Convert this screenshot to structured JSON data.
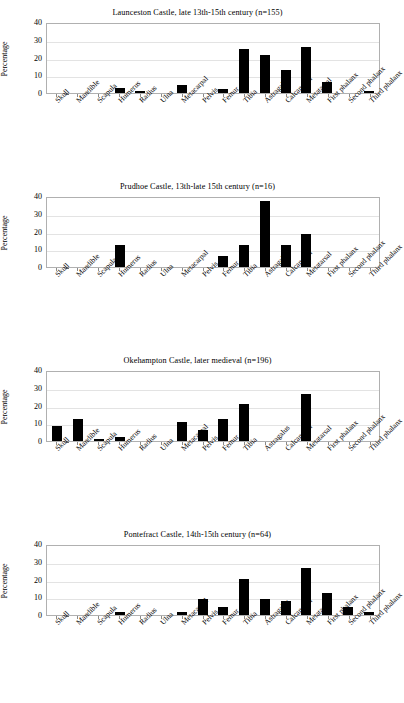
{
  "figure": {
    "categories": [
      "Skull",
      "Mandible",
      "Scapula",
      "Humerus",
      "Radius",
      "Ulna",
      "Metacarpal",
      "Pelvis",
      "Femur",
      "Tibia",
      "Astragalus",
      "Calcaneum",
      "Metatarsal",
      "First phalanx",
      "Second phalanx",
      "Third phalanx"
    ],
    "ylabel": "Percentage",
    "yticks": [
      "0",
      "10",
      "20",
      "30",
      "40"
    ],
    "ylim": [
      0,
      40
    ]
  },
  "chart_data": [
    {
      "type": "bar",
      "title": "Launceston Castle, late 13th-15th century (n=155)",
      "xlabel": "",
      "ylabel": "Percentage",
      "ylim": [
        0,
        40
      ],
      "yticks": [
        0,
        10,
        20,
        30,
        40
      ],
      "grid": true,
      "legend": "none",
      "categories": [
        "Skull",
        "Mandible",
        "Scapula",
        "Humerus",
        "Radius",
        "Ulna",
        "Metacarpal",
        "Pelvis",
        "Femur",
        "Tibia",
        "Astragalus",
        "Calcaneum",
        "Metatarsal",
        "First phalanx",
        "Second phalanx",
        "Third phalanx"
      ],
      "values": [
        0,
        0,
        0,
        2.6,
        1.3,
        0,
        4.5,
        0,
        2.3,
        25.2,
        21.9,
        12.9,
        26.5,
        6.5,
        0,
        1.3
      ]
    },
    {
      "type": "bar",
      "title": "Prudhoe Castle, 13th-late 15th century (n=16)",
      "xlabel": "",
      "ylabel": "Percentage",
      "ylim": [
        0,
        40
      ],
      "yticks": [
        0,
        10,
        20,
        30,
        40
      ],
      "grid": true,
      "legend": "none",
      "categories": [
        "Skull",
        "Mandible",
        "Scapula",
        "Humerus",
        "Radius",
        "Ulna",
        "Metacarpal",
        "Pelvis",
        "Femur",
        "Tibia",
        "Astragalus",
        "Calcaneum",
        "Metatarsal",
        "First phalanx",
        "Second phalanx",
        "Third phalanx"
      ],
      "values": [
        0,
        0,
        0,
        12.5,
        0,
        0,
        0,
        0,
        6.3,
        12.5,
        37.5,
        12.5,
        18.8,
        0,
        0,
        0
      ]
    },
    {
      "type": "bar",
      "title": "Okehampton Castle, later medieval (n=196)",
      "xlabel": "",
      "ylabel": "Percentage",
      "ylim": [
        0,
        40
      ],
      "yticks": [
        0,
        10,
        20,
        30,
        40
      ],
      "grid": true,
      "legend": "none",
      "categories": [
        "Skull",
        "Mandible",
        "Scapula",
        "Humerus",
        "Radius",
        "Ulna",
        "Metacarpal",
        "Pelvis",
        "Femur",
        "Tibia",
        "Astragalus",
        "Calcaneum",
        "Metatarsal",
        "First phalanx",
        "Second phalanx",
        "Third phalanx"
      ],
      "values": [
        8.5,
        12.8,
        1.2,
        2.1,
        0,
        0,
        10.6,
        6.5,
        12.8,
        21.2,
        0,
        0,
        26.8,
        0,
        0,
        0
      ]
    },
    {
      "type": "bar",
      "title": "Pontefract Castle, 14th-15th century (n=64)",
      "xlabel": "",
      "ylabel": "Percentage",
      "ylim": [
        0,
        40
      ],
      "yticks": [
        0,
        10,
        20,
        30,
        40
      ],
      "grid": true,
      "legend": "none",
      "categories": [
        "Skull",
        "Mandible",
        "Scapula",
        "Humerus",
        "Radius",
        "Ulna",
        "Metacarpal",
        "Pelvis",
        "Femur",
        "Tibia",
        "Astragalus",
        "Calcaneum",
        "Metatarsal",
        "First phalanx",
        "Second phalanx",
        "Third phalanx"
      ],
      "values": [
        0,
        0,
        0,
        1.6,
        0,
        0,
        1.6,
        9.4,
        4.7,
        20.3,
        9.4,
        7.8,
        26.6,
        12.5,
        4.7,
        1.6
      ]
    }
  ]
}
